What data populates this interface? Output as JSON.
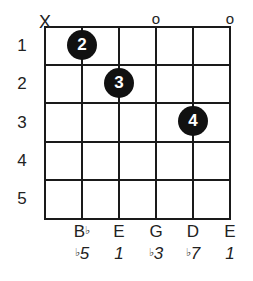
{
  "diagram": {
    "type": "guitar-chord-diagram",
    "strings_count": 6,
    "frets_shown": 5,
    "fret_numbers": [
      "1",
      "2",
      "3",
      "4",
      "5"
    ],
    "open_muted": [
      {
        "string": 1,
        "marker": "X"
      },
      {
        "string": 4,
        "marker": "o"
      },
      {
        "string": 6,
        "marker": "o"
      }
    ],
    "fingers": [
      {
        "string": 2,
        "fret": 1,
        "finger": "2"
      },
      {
        "string": 3,
        "fret": 2,
        "finger": "3"
      },
      {
        "string": 5,
        "fret": 3,
        "finger": "4"
      }
    ],
    "notes": [
      {
        "string": 2,
        "flat": "♭",
        "name": "B",
        "interval_flat": "♭",
        "interval": "5"
      },
      {
        "string": 3,
        "flat": "",
        "name": "E",
        "interval_flat": "",
        "interval": "1"
      },
      {
        "string": 4,
        "flat": "",
        "name": "G",
        "interval_flat": "♭",
        "interval": "3"
      },
      {
        "string": 5,
        "flat": "",
        "name": "D",
        "interval_flat": "♭",
        "interval": "7"
      },
      {
        "string": 6,
        "flat": "",
        "name": "E",
        "interval_flat": "",
        "interval": "1"
      }
    ]
  }
}
